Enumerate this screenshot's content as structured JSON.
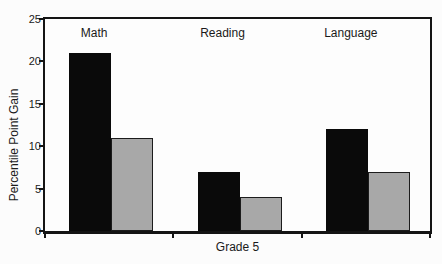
{
  "chart_data": {
    "type": "bar",
    "xlabel": "Grade 5",
    "ylabel": "Percentile Point Gain",
    "ylim": [
      0,
      25
    ],
    "yticks": [
      0,
      5,
      10,
      15,
      20,
      25
    ],
    "grid": false,
    "legend": "none",
    "categories": [
      "Math",
      "Reading",
      "Language"
    ],
    "series": [
      {
        "name": "black-bars",
        "color": "#0a0a0a",
        "values": [
          21,
          7,
          12
        ]
      },
      {
        "name": "gray-bars",
        "color": "#a8a8a8",
        "values": [
          11,
          4,
          7
        ]
      }
    ],
    "colors": {
      "axis": "#141414",
      "text": "#1a1a1a",
      "background": "#fcfcfc",
      "gray_bar_border": "#1c1c1c"
    }
  }
}
